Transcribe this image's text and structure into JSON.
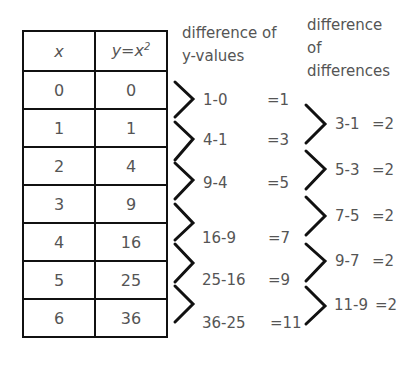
{
  "table": {
    "headers": [
      "x",
      "y=x",
      "2"
    ],
    "rows": [
      {
        "x": "0",
        "y": "0"
      },
      {
        "x": "1",
        "y": "1"
      },
      {
        "x": "2",
        "y": "4"
      },
      {
        "x": "3",
        "y": "9"
      },
      {
        "x": "4",
        "y": "16"
      },
      {
        "x": "5",
        "y": "25"
      },
      {
        "x": "6",
        "y": "36"
      }
    ]
  },
  "first_differences": {
    "title_line1": "difference of",
    "title_line2": "y-values",
    "items": [
      {
        "expr": "1-0",
        "result": "=1"
      },
      {
        "expr": "4-1",
        "result": "=3"
      },
      {
        "expr": "9-4",
        "result": "=5"
      },
      {
        "expr": "16-9",
        "result": "=7"
      },
      {
        "expr": "25-16",
        "result": "=9"
      },
      {
        "expr": "36-25",
        "result": "=11"
      }
    ]
  },
  "second_differences": {
    "title_line1": "difference",
    "title_line2": "of",
    "title_line3": "differences",
    "items": [
      {
        "expr": "3-1",
        "result": "=2"
      },
      {
        "expr": "5-3",
        "result": "=2"
      },
      {
        "expr": "7-5",
        "result": "=2"
      },
      {
        "expr": "9-7",
        "result": "=2"
      },
      {
        "expr": "11-9",
        "result": "=2"
      }
    ]
  }
}
